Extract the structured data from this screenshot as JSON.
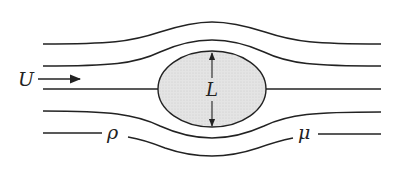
{
  "diagram": {
    "type": "flow-past-body",
    "labels": {
      "velocity": "U",
      "length": "L",
      "density": "ρ",
      "viscosity": "μ"
    },
    "colors": {
      "line": "#222222",
      "body_fill": "#e2e2e2",
      "background": "#ffffff"
    },
    "body": {
      "shape": "ellipse",
      "cx": 212,
      "cy": 89,
      "rx": 54,
      "ry": 38
    },
    "streamline_count": 5
  }
}
